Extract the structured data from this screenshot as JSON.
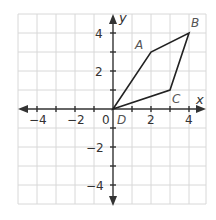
{
  "diagram": {
    "type": "coordinate-plane",
    "axes": {
      "x_label": "x",
      "y_label": "y",
      "x_range": [
        -5,
        5
      ],
      "y_range": [
        -5,
        5
      ],
      "x_ticks": [
        {
          "value": -4,
          "label": "−4"
        },
        {
          "value": -2,
          "label": "−2"
        },
        {
          "value": 0,
          "label": "0"
        },
        {
          "value": 2,
          "label": "2"
        },
        {
          "value": 4,
          "label": "4"
        }
      ],
      "y_ticks": [
        {
          "value": 4,
          "label": "4"
        },
        {
          "value": 2,
          "label": "2"
        },
        {
          "value": -2,
          "label": "−2"
        },
        {
          "value": -4,
          "label": "−4"
        }
      ]
    },
    "points": [
      {
        "name": "A",
        "x": 2,
        "y": 3
      },
      {
        "name": "B",
        "x": 4,
        "y": 4
      },
      {
        "name": "C",
        "x": 3,
        "y": 1
      },
      {
        "name": "D",
        "x": 0,
        "y": 0
      }
    ],
    "polygon": [
      "D",
      "A",
      "B",
      "C"
    ],
    "colors": {
      "grid": "#d8d8d8",
      "axis": "#333333",
      "shape": "#222222",
      "label": "#555555"
    }
  }
}
